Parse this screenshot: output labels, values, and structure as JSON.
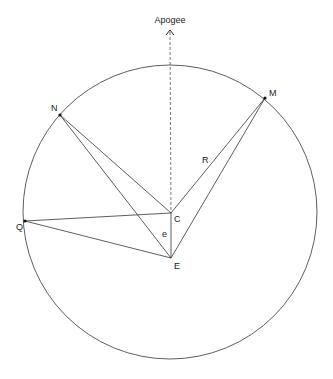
{
  "diagram": {
    "colors": {
      "line": "#333333",
      "dashed": "#555555",
      "point": "#111111",
      "text": "#222222",
      "background": "#ffffff"
    },
    "circle": {
      "cx": 170,
      "cy": 212,
      "r": 147
    },
    "apogee": {
      "label": "Apogee",
      "label_pos": [
        170,
        23
      ],
      "arrow_tip": [
        170,
        30
      ],
      "line_from": [
        170,
        32
      ],
      "line_to": [
        171,
        213
      ]
    },
    "points": {
      "C": {
        "label": "C",
        "x": 171,
        "y": 213,
        "label_dx": 3,
        "label_dy": 9
      },
      "E": {
        "label": "E",
        "x": 171,
        "y": 258,
        "label_dx": 3,
        "label_dy": 11
      },
      "N": {
        "label": "N",
        "x": 60,
        "y": 115,
        "label_dx": -9,
        "label_dy": -4
      },
      "M": {
        "label": "M",
        "x": 265,
        "y": 98,
        "label_dx": 4,
        "label_dy": -2
      },
      "Q": {
        "label": "Q",
        "x": 25,
        "y": 221,
        "label_dx": -9,
        "label_dy": 9
      }
    },
    "segments": [
      {
        "from": "N",
        "to": "C"
      },
      {
        "from": "N",
        "to": "E"
      },
      {
        "from": "Q",
        "to": "C"
      },
      {
        "from": "Q",
        "to": "E"
      },
      {
        "from": "M",
        "to": "C"
      },
      {
        "from": "M",
        "to": "E"
      },
      {
        "from": "C",
        "to": "E"
      }
    ],
    "annotations": {
      "R": {
        "label": "R",
        "x": 202,
        "y": 163
      },
      "e": {
        "label": "e",
        "x": 162,
        "y": 237
      }
    }
  }
}
